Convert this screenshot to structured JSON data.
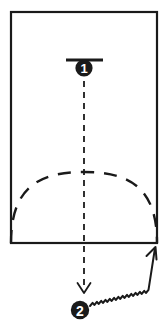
{
  "diagram": {
    "background_color": "#ffffff",
    "ink_color": "#1a1a1a",
    "paper": {
      "shape_name": "rectangle",
      "x": 11,
      "y": 12,
      "width": 146,
      "height": 231,
      "stroke_width": 2.2
    },
    "markers": [
      {
        "id": "marker-1",
        "label": "1",
        "cx": 84,
        "cy": 68,
        "r": 8.6,
        "font_size": 13
      },
      {
        "id": "marker-2",
        "label": "2",
        "cx": 80,
        "cy": 310,
        "r": 9.2,
        "font_size": 14
      }
    ],
    "fold_bar": {
      "name": "valley-fold-bar",
      "x1": 66,
      "y1": 60,
      "x2": 103,
      "y2": 60,
      "stroke_width": 3.2
    },
    "dashed_center_line": {
      "name": "vertical-fold-crease",
      "x1": 84,
      "y1": 70,
      "x2": 84,
      "y2": 288,
      "dash": "6 5",
      "stroke_width": 1.8,
      "arrowhead": "down"
    },
    "dashed_arc": {
      "name": "curved-fold-crease",
      "start_x": 11,
      "start_y": 243,
      "peak_x": 84,
      "peak_y": 172,
      "end_x": 157,
      "end_y": 243,
      "dash": "13 10",
      "stroke_width": 2.4
    },
    "zigzag_arrow": {
      "name": "rotate-pull-arrow",
      "start_x": 90,
      "start_y": 306,
      "end_x": 155,
      "end_y": 248,
      "amplitude": 2.0,
      "stroke_width": 2.0,
      "arrowhead": "up-right"
    }
  }
}
